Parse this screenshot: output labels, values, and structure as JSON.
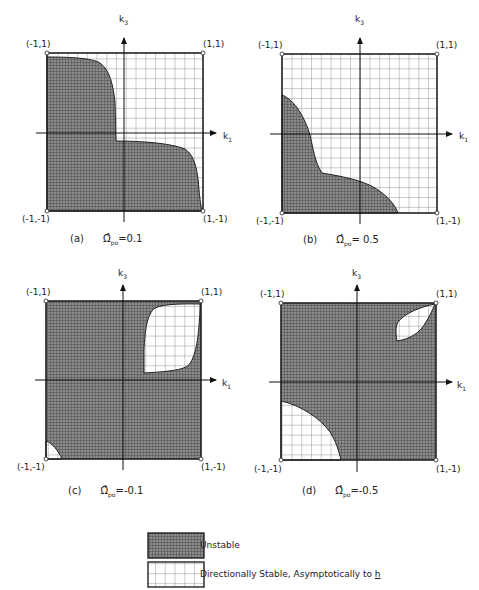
{
  "figure": {
    "axes": {
      "x_label": "k",
      "x_sub": "1",
      "y_label": "k",
      "y_sub": "3"
    },
    "corner_labels": {
      "top_left": "(-1,1)",
      "top_right": "(1,1)",
      "bottom_left": "(-1,-1)",
      "bottom_right": "(1,-1)"
    },
    "panels": [
      {
        "id": "a",
        "tag": "(a)",
        "param_symbol": "Ω̂",
        "param_sub": "po",
        "param_value": "=0.1"
      },
      {
        "id": "b",
        "tag": "(b)",
        "param_symbol": "Ω̂",
        "param_sub": "po",
        "param_value": "= 0.5"
      },
      {
        "id": "c",
        "tag": "(c)",
        "param_symbol": "Ω̂",
        "param_sub": "po",
        "param_value": "=-0.1"
      },
      {
        "id": "d",
        "tag": "(d)",
        "param_symbol": "Ω̂",
        "param_sub": "po",
        "param_value": "=-0.5"
      }
    ],
    "legend": [
      {
        "pattern": "dense-dark-grid",
        "label": "Unstable"
      },
      {
        "pattern": "open-grid",
        "label": "Directionally Stable, Asymptotically to ",
        "vector": "h"
      }
    ],
    "colors": {
      "unstable_fill": "#7a7a7a",
      "grid_line": "#555555",
      "border": "#222222",
      "background": "#ffffff"
    }
  }
}
